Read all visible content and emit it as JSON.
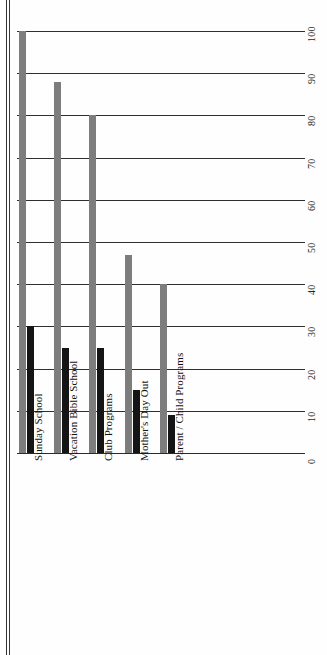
{
  "chart_data": {
    "type": "bar",
    "orientation": "vertical-rotated-90",
    "title": "",
    "subtitle": "",
    "xlabel": "",
    "ylabel": "",
    "ylim": [
      0,
      100
    ],
    "grid": true,
    "legend": "none",
    "categories": [
      "Sunday School",
      "Vacation Bible School",
      "Club Programs",
      "Mother's Day Out",
      "Parent / Child Programs"
    ],
    "tick_labels": [
      "0",
      "10",
      "20",
      "30",
      "40",
      "50",
      "60",
      "70",
      "80",
      "90",
      "100"
    ],
    "tick_values": [
      0,
      10,
      20,
      30,
      40,
      50,
      60,
      70,
      80,
      90,
      100
    ],
    "series": [
      {
        "name": "Series A",
        "color": "#7d7d7d",
        "values": [
          100,
          88,
          80,
          47,
          40
        ]
      },
      {
        "name": "Series B",
        "color": "#151515",
        "values": [
          30,
          25,
          25,
          15,
          9
        ]
      }
    ]
  }
}
